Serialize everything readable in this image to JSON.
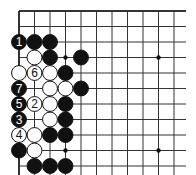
{
  "diagram": {
    "type": "go-board",
    "title": "",
    "view": "top-left corner region, top edge and left edge visible",
    "grid": {
      "origin_x": 19,
      "origin_y": 11,
      "spacing": 15.5,
      "cols": 11,
      "rows": 11,
      "line_color": "#333333",
      "edge_line_width": 2,
      "inner_line_width": 1
    },
    "hoshi": [
      {
        "col": 3,
        "row": 3
      },
      {
        "col": 9,
        "row": 3
      },
      {
        "col": 3,
        "row": 9
      },
      {
        "col": 9,
        "row": 9
      }
    ],
    "stones": [
      {
        "color": "black",
        "col": 0,
        "row": 2,
        "label": "1"
      },
      {
        "color": "black",
        "col": 1,
        "row": 2,
        "label": ""
      },
      {
        "color": "black",
        "col": 2,
        "row": 2,
        "label": ""
      },
      {
        "color": "white",
        "col": 1,
        "row": 3,
        "label": ""
      },
      {
        "color": "black",
        "col": 2,
        "row": 3,
        "label": ""
      },
      {
        "color": "black",
        "col": 4,
        "row": 3,
        "label": ""
      },
      {
        "color": "white",
        "col": 0,
        "row": 4,
        "label": ""
      },
      {
        "color": "white",
        "col": 1,
        "row": 4,
        "label": "6"
      },
      {
        "color": "white",
        "col": 2,
        "row": 4,
        "label": ""
      },
      {
        "color": "black",
        "col": 3,
        "row": 4,
        "label": ""
      },
      {
        "color": "black",
        "col": 0,
        "row": 5,
        "label": "7"
      },
      {
        "color": "white",
        "col": 2,
        "row": 5,
        "label": ""
      },
      {
        "color": "white",
        "col": 3,
        "row": 5,
        "label": ""
      },
      {
        "color": "black",
        "col": 4,
        "row": 5,
        "label": ""
      },
      {
        "color": "black",
        "col": 0,
        "row": 6,
        "label": "5"
      },
      {
        "color": "white",
        "col": 1,
        "row": 6,
        "label": "2"
      },
      {
        "color": "white",
        "col": 2,
        "row": 6,
        "label": ""
      },
      {
        "color": "black",
        "col": 3,
        "row": 6,
        "label": ""
      },
      {
        "color": "black",
        "col": 0,
        "row": 7,
        "label": "3"
      },
      {
        "color": "white",
        "col": 2,
        "row": 7,
        "label": ""
      },
      {
        "color": "black",
        "col": 3,
        "row": 7,
        "label": ""
      },
      {
        "color": "white",
        "col": 0,
        "row": 8,
        "label": "4"
      },
      {
        "color": "white",
        "col": 1,
        "row": 8,
        "label": ""
      },
      {
        "color": "black",
        "col": 2,
        "row": 8,
        "label": ""
      },
      {
        "color": "black",
        "col": 3,
        "row": 8,
        "label": ""
      },
      {
        "color": "black",
        "col": 0,
        "row": 9,
        "label": ""
      },
      {
        "color": "white",
        "col": 1,
        "row": 9,
        "label": ""
      },
      {
        "color": "black",
        "col": 1,
        "row": 10,
        "label": ""
      },
      {
        "color": "black",
        "col": 2,
        "row": 10,
        "label": ""
      },
      {
        "color": "black",
        "col": 3,
        "row": 10,
        "label": ""
      }
    ],
    "colors": {
      "black_stone": "#111111",
      "white_stone": "#ffffff",
      "stone_outline": "#111111",
      "board": "#ffffff"
    }
  }
}
